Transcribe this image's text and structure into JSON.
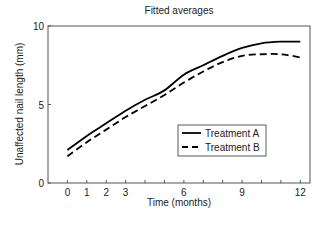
{
  "chart_data": {
    "type": "line",
    "title": "Fitted averages",
    "xlabel": "Time (months)",
    "ylabel": "Unaffected nail length (mm)",
    "xlim": [
      -1,
      12.5
    ],
    "ylim": [
      0,
      10
    ],
    "x_ticks": [
      0,
      1,
      2,
      3,
      4,
      5,
      6,
      7,
      8,
      9,
      10,
      11,
      12
    ],
    "x_tick_labels": [
      "0",
      "1",
      "2",
      "3",
      "",
      "",
      "6",
      "",
      "",
      "9",
      "",
      "",
      "12"
    ],
    "y_ticks": [
      0,
      5,
      10
    ],
    "y_tick_labels": [
      "0",
      "5",
      "10"
    ],
    "grid": false,
    "legend_position": "lower right (inside)",
    "x": [
      0,
      1,
      2,
      3,
      4,
      5,
      6,
      7,
      8,
      9,
      10,
      11,
      12
    ],
    "series": [
      {
        "name": "Treatment A",
        "style": "solid",
        "color": "#000000",
        "values": [
          2.1,
          3.0,
          3.8,
          4.6,
          5.3,
          5.9,
          6.9,
          7.5,
          8.1,
          8.6,
          8.9,
          9.0,
          9.0
        ]
      },
      {
        "name": "Treatment B",
        "style": "dashed",
        "color": "#000000",
        "values": [
          1.7,
          2.6,
          3.4,
          4.2,
          4.9,
          5.6,
          6.4,
          7.1,
          7.7,
          8.1,
          8.2,
          8.2,
          8.0
        ]
      }
    ]
  }
}
